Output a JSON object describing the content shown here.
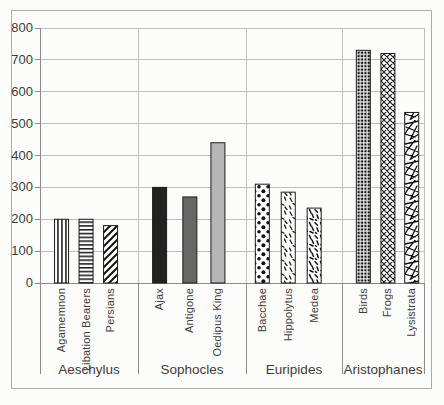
{
  "colors": {
    "background": "#fcfcfa",
    "frame_border": "#ababab",
    "grid": "#c0c0c0",
    "axis": "#8c8c8c",
    "text": "#3c3c3c",
    "bar_outline": "#1c1c1c",
    "solid_black": "#222222",
    "solid_dark_gray": "#676767",
    "solid_light_gray": "#b6b6b6"
  },
  "chart_data": {
    "type": "bar",
    "title": "",
    "xlabel": "",
    "ylabel": "",
    "ylim": [
      0,
      800
    ],
    "yticks": [
      0,
      100,
      200,
      300,
      400,
      500,
      600,
      700,
      800
    ],
    "grid": true,
    "legend": false,
    "groups": [
      {
        "label": "Aeschylus",
        "bars": [
          {
            "label": "Agamemnon",
            "value": 200,
            "pattern": "vertical-stripes"
          },
          {
            "label": "Libation Bearers",
            "value": 200,
            "pattern": "horizontal-stripes"
          },
          {
            "label": "Persians",
            "value": 180,
            "pattern": "diagonal-stripes"
          }
        ]
      },
      {
        "label": "Sophocles",
        "bars": [
          {
            "label": "Ajax",
            "value": 300,
            "pattern": "solid-black"
          },
          {
            "label": "Antigone",
            "value": 270,
            "pattern": "solid-dark-gray"
          },
          {
            "label": "Oedipus King",
            "value": 440,
            "pattern": "solid-light-gray"
          }
        ]
      },
      {
        "label": "Euripides",
        "bars": [
          {
            "label": "Bacchae",
            "value": 310,
            "pattern": "polka-dots"
          },
          {
            "label": "Hippolytus",
            "value": 285,
            "pattern": "scatter-ticks"
          },
          {
            "label": "Medea",
            "value": 235,
            "pattern": "scatter-dashes"
          }
        ]
      },
      {
        "label": "Aristophanes",
        "bars": [
          {
            "label": "Birds",
            "value": 730,
            "pattern": "checker"
          },
          {
            "label": "Frogs",
            "value": 720,
            "pattern": "crosshatch"
          },
          {
            "label": "Lysistrata",
            "value": 535,
            "pattern": "shatter"
          }
        ]
      }
    ]
  }
}
